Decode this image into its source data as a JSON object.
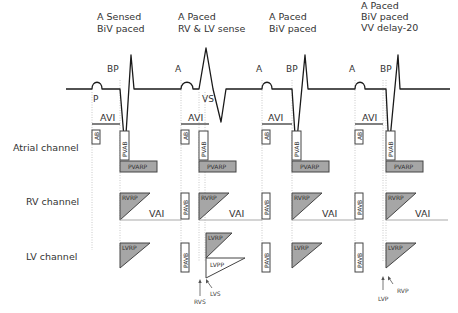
{
  "beats": [
    {
      "title_lines": [
        "A Sensed",
        "BiV paced"
      ]
    },
    {
      "title_lines": [
        "A Paced",
        "RV & LV sense"
      ]
    },
    {
      "title_lines": [
        "A Paced",
        "BiV paced"
      ]
    },
    {
      "title_lines": [
        "A Paced",
        "BiV paced",
        "VV delay-20"
      ]
    }
  ],
  "ecg_markers": {
    "p": "P",
    "a": "A",
    "bp": "BP",
    "vs": "VS"
  },
  "channels": {
    "atrial": "Atrial channel",
    "rv": "RV channel",
    "lv": "LV channel"
  },
  "intervals": {
    "avi": "AVI",
    "vai": "VAI",
    "ab": "AB",
    "pvab": "PVAB",
    "pvarp": "PVARP",
    "pavb": "PAVB",
    "rvrp": "RVRP",
    "lvrp": "LVRP",
    "lvpp": "LVPP"
  },
  "annotations": {
    "rvs": "RVS",
    "lvs": "LVS",
    "lvp": "LVP",
    "rvp": "RVP"
  },
  "colors": {
    "line": "#1a1a1a",
    "box_fill_gray": "#a6a6a6",
    "box_stroke": "#444444",
    "dotted": "#bbbbbb",
    "vai_line": "#aaaaaa"
  }
}
